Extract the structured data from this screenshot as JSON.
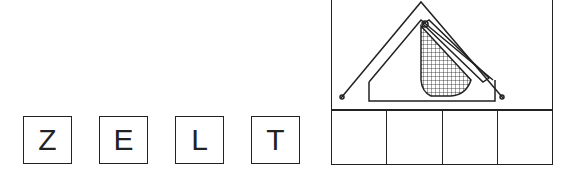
{
  "word": {
    "letters": [
      "Z",
      "E",
      "L",
      "T"
    ]
  },
  "picture": {
    "subject": "tent-icon",
    "answer_cells": 4
  },
  "colors": {
    "ink": "#222222",
    "background": "#ffffff"
  }
}
